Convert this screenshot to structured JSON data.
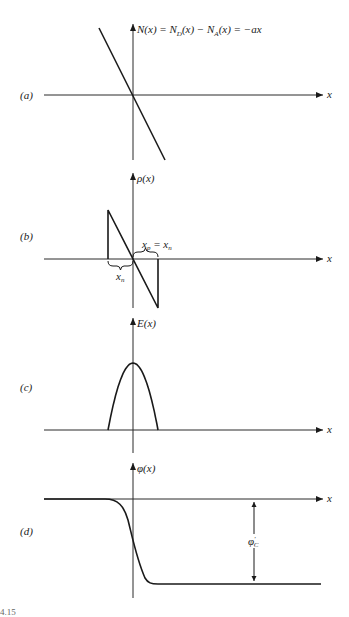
{
  "figure": {
    "caption_fragment": "4.15",
    "panels": [
      {
        "id": "a",
        "label": "(a)",
        "x_axis_label": "x",
        "y_axis_label": "N(x) = N_D(x) − N_A(x) = −ax",
        "y_label_parts": [
          "N(x) = N",
          "D",
          "(x) − N",
          "A",
          "(x) = −ax"
        ],
        "curve": "linear, negative slope through origin"
      },
      {
        "id": "b",
        "label": "(b)",
        "x_axis_label": "x",
        "y_axis_label": "ρ(x)",
        "annotations": {
          "left_brace": "x_n",
          "left_brace_parts": [
            "x",
            "n"
          ],
          "right_brace": "x_p = x_n",
          "right_brace_parts": [
            "x",
            "p",
            " = x",
            "n"
          ]
        },
        "curve": "linear charge density between −x_n and x_p"
      },
      {
        "id": "c",
        "label": "(c)",
        "x_axis_label": "x",
        "y_axis_label": "E(x)",
        "curve": "parabolic field profile, zero outside depletion region"
      },
      {
        "id": "d",
        "label": "(d)",
        "x_axis_label": "x",
        "y_axis_label": "φ(x)",
        "annotation": "φ'_C",
        "annotation_parts": [
          "φ",
          "′",
          "C"
        ],
        "curve": "potential step from 0 down to −φ'_C"
      }
    ]
  },
  "chart_data": [
    {
      "type": "line",
      "title": "(a)",
      "xlabel": "x",
      "ylabel": "N(x) = N_D(x) − N_A(x) = −ax",
      "series": [
        {
          "name": "N(x)",
          "x": [
            -1,
            1
          ],
          "y": [
            2,
            -2
          ]
        }
      ],
      "xlim": [
        -3.2,
        5.5
      ],
      "ylim": [
        -2,
        2
      ],
      "grid": false
    },
    {
      "type": "line",
      "title": "(b)",
      "xlabel": "x",
      "ylabel": "ρ(x)",
      "series": [
        {
          "name": "ρ(x)",
          "x": [
            -1,
            -1,
            1,
            1
          ],
          "y": [
            0,
            1,
            -1,
            0
          ]
        }
      ],
      "xlim": [
        -3.2,
        5.5
      ],
      "ylim": [
        -1,
        1.2
      ],
      "grid": false
    },
    {
      "type": "line",
      "title": "(c)",
      "xlabel": "x",
      "ylabel": "E(x)",
      "series": [
        {
          "name": "E(x)",
          "x": [
            -1,
            -0.5,
            0,
            0.5,
            1
          ],
          "y": [
            0,
            0.75,
            1,
            0.75,
            0
          ]
        }
      ],
      "xlim": [
        -3.2,
        5.5
      ],
      "ylim": [
        0,
        1.5
      ],
      "grid": false
    },
    {
      "type": "line",
      "title": "(d)",
      "xlabel": "x",
      "ylabel": "φ(x)",
      "series": [
        {
          "name": "φ(x)",
          "x": [
            -3.2,
            -1,
            0,
            1,
            7.2
          ],
          "y": [
            0,
            0,
            -0.5,
            -1,
            -1
          ]
        }
      ],
      "annotations": [
        "φ'_C"
      ],
      "xlim": [
        -3.2,
        5.5
      ],
      "ylim": [
        -1,
        0.4
      ],
      "grid": false
    }
  ]
}
